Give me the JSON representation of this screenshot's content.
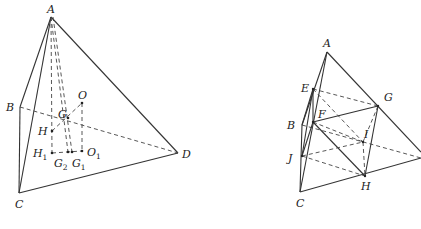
{
  "figures": [
    {
      "id": "left",
      "labels": {
        "A": "A",
        "B": "B",
        "C": "C",
        "D": "D",
        "O": "O",
        "G": "G",
        "H": "H",
        "H1": "H",
        "H1_sub": "1",
        "G2": "G",
        "G2_sub": "2",
        "G1": "G",
        "G1_sub": "1",
        "O1": "O",
        "O1_sub": "1"
      },
      "points": {
        "A": [
          51,
          17
        ],
        "B": [
          20,
          107
        ],
        "C": [
          19,
          193
        ],
        "D": [
          178,
          153
        ],
        "G": [
          68,
          118
        ],
        "O": [
          82,
          103
        ],
        "H": [
          52,
          131
        ],
        "H1": [
          52,
          153
        ],
        "G2": [
          68,
          152
        ],
        "G1": [
          72,
          152
        ],
        "O1": [
          82,
          151
        ]
      }
    },
    {
      "id": "right",
      "labels": {
        "A": "A",
        "B": "B",
        "C": "C",
        "E": "E",
        "F": "F",
        "G": "G",
        "H": "H",
        "I": "I",
        "J": "J"
      },
      "points": {
        "A": [
          327,
          52
        ],
        "B": [
          302,
          125
        ],
        "C": [
          300,
          192
        ],
        "D": [
          421,
          158
        ],
        "E": [
          313,
          89
        ],
        "F": [
          313,
          122
        ],
        "G": [
          378,
          106
        ],
        "H": [
          365,
          176
        ],
        "I": [
          363,
          142
        ],
        "J": [
          302,
          156
        ]
      }
    }
  ]
}
